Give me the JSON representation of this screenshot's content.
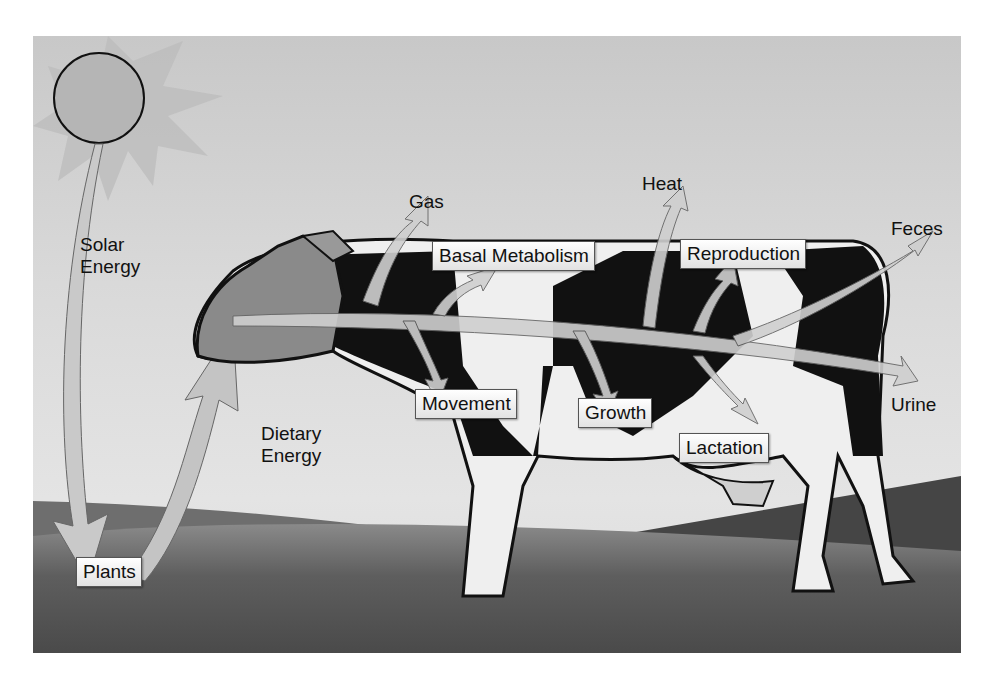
{
  "diagram": {
    "type": "energy-flow illustration",
    "labels": {
      "solar": "Solar\nEnergy",
      "solar_l1": "Solar",
      "solar_l2": "Energy",
      "dietary_l1": "Dietary",
      "dietary_l2": "Energy",
      "gas": "Gas",
      "heat": "Heat",
      "feces": "Feces",
      "urine": "Urine"
    },
    "boxes": {
      "plants": "Plants",
      "basal": "Basal Metabolism",
      "reproduction": "Reproduction",
      "movement": "Movement",
      "growth": "Growth",
      "lactation": "Lactation"
    },
    "flows": [
      {
        "from": "Sun",
        "to": "Plants",
        "label": "Solar Energy"
      },
      {
        "from": "Plants",
        "to": "Cow",
        "label": "Dietary Energy"
      },
      {
        "from": "Cow",
        "to": "Gas"
      },
      {
        "from": "Cow",
        "to": "Basal Metabolism"
      },
      {
        "from": "Cow",
        "to": "Movement"
      },
      {
        "from": "Cow",
        "to": "Heat"
      },
      {
        "from": "Cow",
        "to": "Growth"
      },
      {
        "from": "Cow",
        "to": "Reproduction"
      },
      {
        "from": "Cow",
        "to": "Lactation"
      },
      {
        "from": "Cow",
        "to": "Feces"
      },
      {
        "from": "Cow",
        "to": "Urine"
      }
    ],
    "colors": {
      "sky": "#d9d9d9",
      "grass": "#5e5e5e",
      "arrow_fill": "#c4c4c4",
      "cow_spots": "#111111",
      "cow_white": "#f0f0f0"
    }
  }
}
